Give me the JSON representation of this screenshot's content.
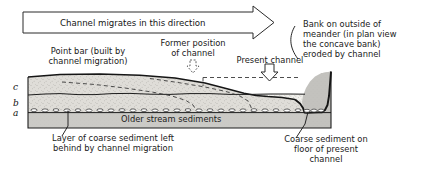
{
  "figure": {
    "type": "geologic-block-diagram",
    "banner": {
      "text": "Channel migrates in this direction",
      "direction": "right",
      "shape": "block-arrow-outline"
    },
    "labels": {
      "point_bar": "Point bar (built by\nchannel migration)",
      "point_bar_line1": "Point bar (built by",
      "point_bar_line2": "channel migration)",
      "former_position": "Former position\nof channel",
      "former_position_line1": "Former position",
      "former_position_line2": "of channel",
      "present_channel": "Present channel",
      "bank_outside": "Bank on outside of\nmeander (in plan view\nthe concave bank)\neroded by channel",
      "bank_line1": "Bank on outside of",
      "bank_line2": "meander (in plan view",
      "bank_line3": "the concave bank)",
      "bank_line4": "eroded by channel",
      "older_sediments": "Older stream sediments",
      "coarse_layer": "Layer of coarse sediment left\nbehind by channel migration",
      "coarse_layer_line1": "Layer of coarse sediment left",
      "coarse_layer_line2": "behind by channel migration",
      "coarse_floor": "Coarse sediment on\nfloor of present\nchannel",
      "coarse_floor_line1": "Coarse sediment on",
      "coarse_floor_line2": "floor of present",
      "coarse_floor_line3": "channel"
    },
    "bed_letters": [
      "c",
      "b",
      "a"
    ],
    "bed_letter_c": "c",
    "bed_letter_b": "b",
    "bed_letter_a": "a",
    "colors": {
      "line": "#1a1a1a",
      "bed_c_fill": "#dedcd8",
      "bed_b_fill": "#efeeea",
      "older_sediment_fill": "#c9c8c4",
      "channel_block_fill": "#c2c1bd",
      "background": "#ffffff",
      "dashed_line": "#333333"
    },
    "arrows": {
      "former_channel_marker": "dashed-down-arrow",
      "present_channel_marker": "hollow-down-arrow",
      "banner_marker": "right-block-arrow"
    },
    "leaders": [
      "coarse-layer-leader",
      "coarse-floor-leader",
      "bank-outside-leader"
    ]
  }
}
